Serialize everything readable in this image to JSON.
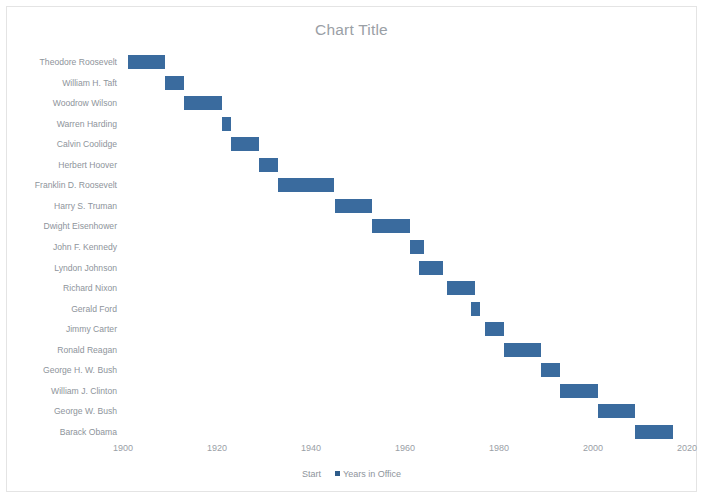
{
  "chart": {
    "title": "Chart Title",
    "bar_color": "#3A6B9E",
    "title_color": "#9aa0a6",
    "axis_text_color": "#9aa0a6",
    "legend": [
      {
        "label": "Start",
        "has_marker": false,
        "color": "transparent"
      },
      {
        "label": "Years in Office",
        "has_marker": true,
        "color": "#2E5C8A"
      }
    ]
  },
  "chart_data": {
    "type": "bar",
    "subtype": "stacked-bar-gantt",
    "orientation": "horizontal",
    "title": "Chart Title",
    "xlabel": "",
    "ylabel": "",
    "xlim": [
      1896,
      2024
    ],
    "xticks": [
      1900,
      1920,
      1940,
      1960,
      1980,
      2000,
      2020
    ],
    "xtick_labels": [
      "1900",
      "1920",
      "1940",
      "1960",
      "1980",
      "2000",
      "2020"
    ],
    "grid": false,
    "legend_position": "bottom",
    "series": [
      {
        "name": "Start",
        "visible": false,
        "values": [
          1901,
          1909,
          1913,
          1921,
          1923,
          1929,
          1933,
          1945,
          1953,
          1961,
          1963,
          1969,
          1974,
          1977,
          1981,
          1989,
          1993,
          2001,
          2009
        ]
      },
      {
        "name": "Years in Office",
        "visible": true,
        "color": "#3A6B9E",
        "values": [
          8,
          4,
          8,
          2,
          6,
          4,
          12,
          8,
          8,
          3,
          5,
          6,
          2,
          4,
          8,
          4,
          8,
          8,
          8
        ]
      }
    ],
    "categories": [
      "Theodore Roosevelt",
      "William H. Taft",
      "Woodrow Wilson",
      "Warren Harding",
      "Calvin Coolidge",
      "Herbert Hoover",
      "Franklin D. Roosevelt",
      "Harry S. Truman",
      "Dwight Eisenhower",
      "John F. Kennedy",
      "Lyndon Johnson",
      "Richard Nixon",
      "Gerald Ford",
      "Jimmy Carter",
      "Ronald Reagan",
      "George H. W. Bush",
      "William J. Clinton",
      "George W. Bush",
      "Barack Obama"
    ],
    "bars": [
      {
        "label": "Theodore Roosevelt",
        "start": 1901,
        "duration": 8
      },
      {
        "label": "William H. Taft",
        "start": 1909,
        "duration": 4
      },
      {
        "label": "Woodrow Wilson",
        "start": 1913,
        "duration": 8
      },
      {
        "label": "Warren Harding",
        "start": 1921,
        "duration": 2
      },
      {
        "label": "Calvin Coolidge",
        "start": 1923,
        "duration": 6
      },
      {
        "label": "Herbert Hoover",
        "start": 1929,
        "duration": 4
      },
      {
        "label": "Franklin D. Roosevelt",
        "start": 1933,
        "duration": 12
      },
      {
        "label": "Harry S. Truman",
        "start": 1945,
        "duration": 8
      },
      {
        "label": "Dwight Eisenhower",
        "start": 1953,
        "duration": 8
      },
      {
        "label": "John F. Kennedy",
        "start": 1961,
        "duration": 3
      },
      {
        "label": "Lyndon Johnson",
        "start": 1963,
        "duration": 5
      },
      {
        "label": "Richard Nixon",
        "start": 1969,
        "duration": 6
      },
      {
        "label": "Gerald Ford",
        "start": 1974,
        "duration": 2
      },
      {
        "label": "Jimmy Carter",
        "start": 1977,
        "duration": 4
      },
      {
        "label": "Ronald Reagan",
        "start": 1981,
        "duration": 8
      },
      {
        "label": "George H. W. Bush",
        "start": 1989,
        "duration": 4
      },
      {
        "label": "William J. Clinton",
        "start": 1993,
        "duration": 8
      },
      {
        "label": "George W. Bush",
        "start": 2001,
        "duration": 8
      },
      {
        "label": "Barack Obama",
        "start": 2009,
        "duration": 8
      }
    ]
  }
}
